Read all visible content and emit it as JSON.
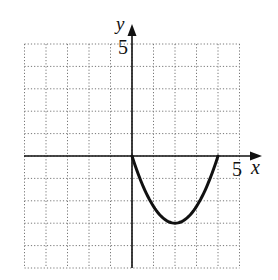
{
  "chart_data": {
    "type": "line",
    "title": "",
    "xlabel": "x",
    "ylabel": "y",
    "xlim": [
      -5,
      5
    ],
    "ylim": [
      -5,
      5
    ],
    "grid": true,
    "grid_style": "dotted",
    "tick_labels": {
      "x": [
        "5"
      ],
      "y": [
        "5"
      ]
    },
    "series": [
      {
        "name": "parabola",
        "description": "upward-opening parabola with x-intercepts at 0 and 4, vertex at (2, -3)",
        "x": [
          0,
          0.5,
          1,
          1.5,
          2,
          2.5,
          3,
          3.5,
          4
        ],
        "y": [
          0,
          -1.3125,
          -2.25,
          -2.8125,
          -3,
          -2.8125,
          -2.25,
          -1.3125,
          0
        ],
        "vertex": [
          2,
          -3
        ],
        "x_intercepts": [
          0,
          4
        ]
      }
    ]
  },
  "labels": {
    "x_axis": "x",
    "y_axis": "y",
    "x_tick": "5",
    "y_tick": "5"
  }
}
